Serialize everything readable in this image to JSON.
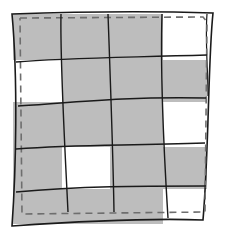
{
  "illustration": {
    "subject": "quilt-grid",
    "columns": 4,
    "rows": 5,
    "colors": {
      "filled": "#bdbdbd",
      "empty": "#ffffff",
      "line": "#1a1a1a",
      "dash": "#6e6e6e"
    },
    "cells": [
      [
        "filled",
        "filled",
        "filled",
        "empty"
      ],
      [
        "empty",
        "filled",
        "filled",
        "filled"
      ],
      [
        "filled",
        "filled",
        "filled",
        "empty"
      ],
      [
        "filled",
        "empty",
        "filled",
        "filled"
      ],
      [
        "filled",
        "filled",
        "filled",
        "empty"
      ]
    ]
  }
}
